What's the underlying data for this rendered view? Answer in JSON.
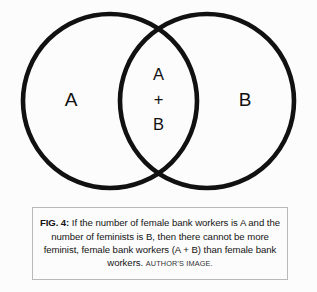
{
  "figure": {
    "background_color": "#fcfcfc",
    "stroke_color": "#111111",
    "diagram": {
      "type": "venn-diagram",
      "left_circle_label": "A",
      "right_circle_label": "B",
      "intersection_labels": [
        "A",
        "+",
        "B"
      ]
    },
    "caption": {
      "figure_number": "FIG. 4:",
      "body": " If the number of female bank workers is A and the number of feminists is B, then there cannot be more feminist, female bank workers (A + B) than female bank workers. ",
      "credit": "AUTHOR'S IMAGE.",
      "border_color": "#b9b9b9"
    }
  }
}
